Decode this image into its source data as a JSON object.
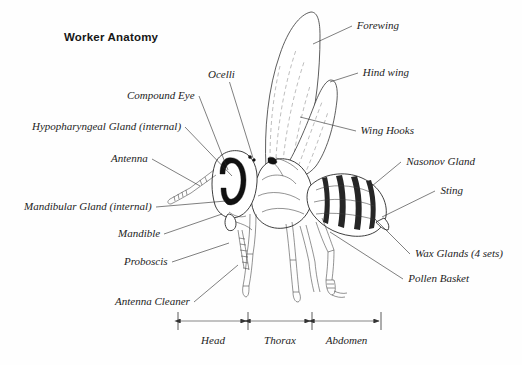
{
  "figure": {
    "title": "Worker Anatomy",
    "background_color": "#fefefe",
    "ink_color": "#1d1d1d"
  },
  "labels_left": [
    {
      "id": "compound-eye",
      "text": "Compound Eye",
      "x": 127,
      "y": 90,
      "anchor_x": 228,
      "anchor_y": 170
    },
    {
      "id": "hypopharyngeal-gland",
      "text": "Hypopharyngeal Gland (internal)",
      "x": 32,
      "y": 121,
      "anchor_x": 232,
      "anchor_y": 176
    },
    {
      "id": "antenna",
      "text": "Antenna",
      "x": 111,
      "y": 153,
      "anchor_x": 200,
      "anchor_y": 186
    },
    {
      "id": "mandibular-gland",
      "text": "Mandibular Gland (internal)",
      "x": 24,
      "y": 201,
      "anchor_x": 226,
      "anchor_y": 201
    },
    {
      "id": "mandible",
      "text": "Mandible",
      "x": 118,
      "y": 228,
      "anchor_x": 222,
      "anchor_y": 214
    },
    {
      "id": "proboscis",
      "text": "Proboscis",
      "x": 124,
      "y": 256,
      "anchor_x": 229,
      "anchor_y": 243
    },
    {
      "id": "antenna-cleaner",
      "text": "Antenna Cleaner",
      "x": 115,
      "y": 296,
      "anchor_x": 238,
      "anchor_y": 265
    }
  ],
  "labels_top": [
    {
      "id": "ocelli",
      "text": "Ocelli",
      "x": 208,
      "y": 69,
      "anchor_x": 253,
      "anchor_y": 158
    }
  ],
  "labels_right": [
    {
      "id": "forewing",
      "text": "Forewing",
      "x": 357,
      "y": 20,
      "anchor_x": 313,
      "anchor_y": 44
    },
    {
      "id": "hind-wing",
      "text": "Hind wing",
      "x": 363,
      "y": 67,
      "anchor_x": 330,
      "anchor_y": 82
    },
    {
      "id": "wing-hooks",
      "text": "Wing Hooks",
      "x": 361,
      "y": 125,
      "anchor_x": 300,
      "anchor_y": 117
    },
    {
      "id": "nasonov-gland",
      "text": "Nasonov Gland",
      "x": 406,
      "y": 156,
      "anchor_x": 372,
      "anchor_y": 186
    },
    {
      "id": "sting",
      "text": "Sting",
      "x": 440,
      "y": 185,
      "anchor_x": 382,
      "anchor_y": 217
    },
    {
      "id": "wax-glands",
      "text": "Wax Glands (4 sets)",
      "x": 415,
      "y": 248,
      "anchor_x": 374,
      "anchor_y": 218
    },
    {
      "id": "pollen-basket",
      "text": "Pollen Basket",
      "x": 408,
      "y": 273,
      "anchor_x": 330,
      "anchor_y": 232
    }
  ],
  "scale_bar": {
    "y": 321,
    "caption_y": 334,
    "ticks": [
      178,
      248,
      312,
      381
    ],
    "segments": [
      {
        "id": "head",
        "label": "Head",
        "start": 178,
        "end": 248
      },
      {
        "id": "thorax",
        "label": "Thorax",
        "start": 248,
        "end": 312
      },
      {
        "id": "abdomen",
        "label": "Abdomen",
        "start": 312,
        "end": 381
      }
    ]
  }
}
